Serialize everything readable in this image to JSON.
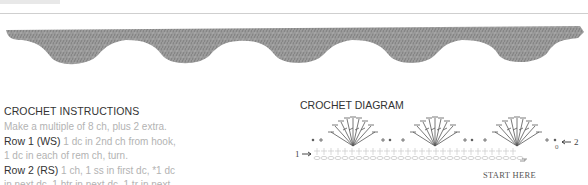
{
  "photo": {
    "description": "Crocheted scalloped edging sample",
    "scallop_count": 7,
    "color": "#9a9a9a"
  },
  "instructions": {
    "heading": "CROCHET INSTRUCTIONS",
    "lines": [
      {
        "label": "",
        "text": "Make a multiple of 8 ch, plus 2 extra."
      },
      {
        "label": "Row 1 (WS)",
        "text": " 1 dc in 2nd ch from hook,"
      },
      {
        "label": "",
        "text": "1 dc in each of rem ch, turn."
      },
      {
        "label": "Row 2 (RS)",
        "text": " 1 ch, 1 ss in first dc, *1 dc"
      },
      {
        "label": "",
        "text": "in next dc, 1 htr in next dc, 1 tr in next"
      }
    ]
  },
  "diagram": {
    "heading": "CROCHET DIAGRAM",
    "row1_label": "1",
    "row2_label": "2",
    "start_label": "START HERE"
  }
}
